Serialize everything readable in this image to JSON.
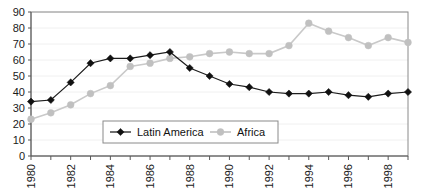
{
  "chart_data": {
    "type": "line",
    "title": "",
    "subtitle": "",
    "xlabel": "",
    "ylabel": "",
    "x": [
      1980,
      1981,
      1982,
      1983,
      1984,
      1985,
      1986,
      1987,
      1988,
      1989,
      1990,
      1991,
      1992,
      1993,
      1994,
      1995,
      1996,
      1997,
      1998,
      1999
    ],
    "xlim": [
      1980,
      1999
    ],
    "ylim": [
      0,
      90
    ],
    "yticks": [
      0,
      10,
      20,
      30,
      40,
      50,
      60,
      70,
      80,
      90
    ],
    "ytick_labels": [
      "0",
      "10",
      "20",
      "30",
      "40",
      "50",
      "60",
      "70",
      "80",
      "90"
    ],
    "xtick_labels": [
      "1980",
      "",
      "1982",
      "",
      "1984",
      "",
      "1986",
      "",
      "1988",
      "",
      "1990",
      "",
      "1992",
      "",
      "1994",
      "",
      "1996",
      "",
      "1998",
      ""
    ],
    "xticks_every": 1,
    "xlabels_every": 2,
    "grid": true,
    "grid_axis": "y",
    "legend_position": "inside-bottom-center",
    "series": [
      {
        "name": "Latin America",
        "color": "#111111",
        "marker": "diamond",
        "values": [
          34,
          35,
          46,
          58,
          61,
          61,
          63,
          65,
          55,
          50,
          45,
          43,
          40,
          39,
          39,
          40,
          38,
          37,
          39,
          40
        ]
      },
      {
        "name": "Africa",
        "color": "#c0c0c0",
        "marker": "circle",
        "values": [
          23,
          27,
          32,
          39,
          44,
          56,
          58,
          61,
          62,
          64,
          65,
          64,
          64,
          69,
          83,
          78,
          74,
          69,
          74,
          71
        ]
      }
    ]
  },
  "legend": {
    "entries": [
      {
        "label": "Latin America",
        "marker": "diamond-marker-icon"
      },
      {
        "label": "Africa",
        "marker": "circle-marker-icon"
      }
    ]
  },
  "axes": {
    "y_axis_name": "y-axis",
    "x_axis_name": "x-axis"
  }
}
